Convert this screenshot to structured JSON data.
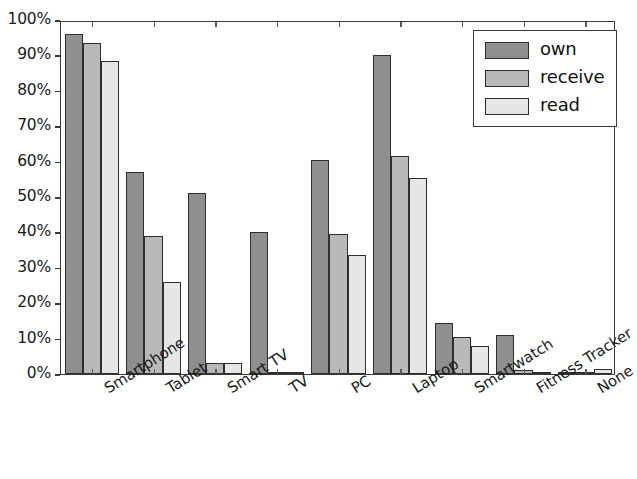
{
  "chart_data": {
    "type": "bar",
    "title": "",
    "subtitle": "",
    "xlabel": "",
    "ylabel": "",
    "ylim": [
      0,
      100
    ],
    "y_unit": "%",
    "grid": false,
    "legend_position": "top-right",
    "categories": [
      "Smartphone",
      "Tablet",
      "Smart TV",
      "TV",
      "PC",
      "Laptop",
      "Smartwatch",
      "Fitness Tracker",
      "None"
    ],
    "ytick_labels": [
      "0%",
      "10%",
      "20%",
      "30%",
      "40%",
      "50%",
      "60%",
      "70%",
      "80%",
      "90%",
      "100%"
    ],
    "ytick_values": [
      0,
      10,
      20,
      30,
      40,
      50,
      60,
      70,
      80,
      90,
      100
    ],
    "series": [
      {
        "name": "own",
        "color": "#8f8f8f",
        "values": [
          96,
          57,
          51,
          40,
          60.5,
          90,
          14.5,
          11,
          0.5
        ]
      },
      {
        "name": "receive",
        "color": "#b9b9b9",
        "values": [
          93.5,
          39,
          3,
          0.5,
          39.5,
          61.5,
          10.5,
          1,
          0.5
        ]
      },
      {
        "name": "read",
        "color": "#e6e6e6",
        "values": [
          88.5,
          26,
          3,
          0.5,
          33.5,
          55.5,
          8,
          0.5,
          1.5
        ]
      }
    ]
  },
  "legend": {
    "entries": [
      {
        "label": "own",
        "color": "#8f8f8f"
      },
      {
        "label": "receive",
        "color": "#b9b9b9"
      },
      {
        "label": "read",
        "color": "#e6e6e6"
      }
    ]
  }
}
